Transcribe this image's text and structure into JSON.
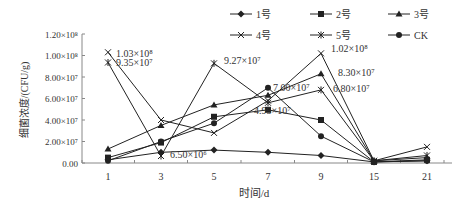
{
  "chart_data": {
    "type": "line",
    "title": "",
    "xlabel": "时间/d",
    "ylabel": "细菌浓度/(CFU/g)",
    "categories": [
      "1",
      "3",
      "5",
      "7",
      "9",
      "15",
      "21"
    ],
    "ylim": [
      0,
      120000000
    ],
    "y_ticks": [
      {
        "value": 0,
        "label": "0.00"
      },
      {
        "value": 20000000,
        "label": "2.00×10⁷"
      },
      {
        "value": 40000000,
        "label": "4.00×10⁷"
      },
      {
        "value": 60000000,
        "label": "6.00×10⁷"
      },
      {
        "value": 80000000,
        "label": "8.00×10⁷"
      },
      {
        "value": 100000000,
        "label": "1.00×10⁸"
      },
      {
        "value": 120000000,
        "label": "1.20×10⁸"
      }
    ],
    "grid": false,
    "legend_position": "top-right",
    "series": [
      {
        "name": "1号",
        "marker": "diamond",
        "values": [
          3000000,
          10000000,
          12000000,
          10000000,
          7000000,
          1000000,
          2000000
        ]
      },
      {
        "name": "2号",
        "marker": "square",
        "values": [
          5000000,
          19000000,
          43000000,
          49500000,
          40000000,
          1000000,
          3000000
        ]
      },
      {
        "name": "3号",
        "marker": "triangle",
        "values": [
          13000000,
          35000000,
          54000000,
          63000000,
          83000000,
          2000000,
          5000000
        ]
      },
      {
        "name": "4号",
        "marker": "x",
        "values": [
          103000000,
          40000000,
          28000000,
          58000000,
          102000000,
          2000000,
          15000000
        ]
      },
      {
        "name": "5号",
        "marker": "star",
        "values": [
          93500000,
          6500000,
          92700000,
          56000000,
          68000000,
          2000000,
          7000000
        ]
      },
      {
        "name": "CK",
        "marker": "circle",
        "values": [
          2000000,
          20000000,
          37000000,
          70000000,
          25000000,
          1000000,
          2000000
        ]
      }
    ],
    "annotations": [
      {
        "text": "1.03×10⁸",
        "x": "1",
        "series": "4号"
      },
      {
        "text": "9.35×10⁷",
        "x": "1",
        "series": "5号"
      },
      {
        "text": "6.50×10⁶",
        "x": "3",
        "series": "5号"
      },
      {
        "text": "9.27×10⁷",
        "x": "5",
        "series": "5号"
      },
      {
        "text": "7.00×10⁷",
        "x": "7",
        "series": "CK"
      },
      {
        "text": "4.95×10⁷",
        "x": "7",
        "series": "2号"
      },
      {
        "text": "1.02×10⁸",
        "x": "9",
        "series": "4号"
      },
      {
        "text": "8.30×10⁷",
        "x": "9",
        "series": "3号"
      },
      {
        "text": "6.80×10⁷",
        "x": "9",
        "series": "5号"
      }
    ]
  }
}
